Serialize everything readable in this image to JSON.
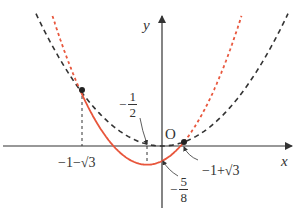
{
  "chart_data": {
    "type": "line",
    "title": "",
    "xlabel": "x",
    "ylabel": "y",
    "origin_label": "O",
    "grid": false,
    "series": [
      {
        "name": "y = x^2/4",
        "style": "black dashed",
        "color": "#333333"
      },
      {
        "name": "y = (x^2 + x - 1)/2",
        "style": "red solid on [-1-sqrt3, -1+sqrt3], red dotted outside",
        "color": "#e8563c"
      }
    ],
    "points": [
      {
        "x": "-1-sqrt3",
        "x_value": -2.732,
        "y_value": 1.866
      },
      {
        "x": "-1+sqrt3",
        "x_value": 0.732,
        "y_value": 0.134
      }
    ],
    "annotations": [
      "-1/2",
      "-5/8",
      "-1-√3",
      "-1+√3"
    ],
    "vertex": {
      "x": -0.5,
      "y": -0.625
    }
  },
  "labels": {
    "y_axis": "y",
    "x_axis": "x",
    "origin": "O",
    "left_root": "−1−√3",
    "right_root": "−1+√3",
    "half": {
      "sign": "−",
      "num": "1",
      "den": "2"
    },
    "five_eighths": {
      "sign": "−",
      "num": "5",
      "den": "8"
    }
  },
  "colors": {
    "axis": "#333333",
    "black_curve": "#333333",
    "red_curve": "#e8563c"
  }
}
